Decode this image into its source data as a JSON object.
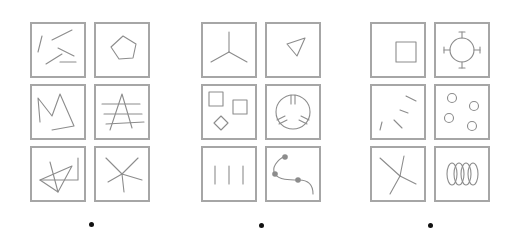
{
  "figure": {
    "type": "odd-one-out visual puzzle panels",
    "stroke_color": "#8c8c8c",
    "border_color": "#a6a6a6",
    "dot_color": "#111111",
    "groups": [
      {
        "id": "A",
        "panels": [
          {
            "row": 0,
            "col": 0,
            "shape": "five scattered line segments"
          },
          {
            "row": 0,
            "col": 1,
            "shape": "pentagon"
          },
          {
            "row": 1,
            "col": 0,
            "shape": "zigzag polyline M shape"
          },
          {
            "row": 1,
            "col": 1,
            "shape": "letter A crossed by three horizontal lines"
          },
          {
            "row": 2,
            "col": 0,
            "shape": "triangle overlapping L-shaped polyline"
          },
          {
            "row": 2,
            "col": 1,
            "shape": "five-ray star of lines"
          }
        ],
        "dot": "•"
      },
      {
        "id": "B",
        "panels": [
          {
            "row": 0,
            "col": 0,
            "shape": "three-ray Y junction"
          },
          {
            "row": 0,
            "col": 1,
            "shape": "small triangle"
          },
          {
            "row": 1,
            "col": 0,
            "shape": "two squares and a diamond"
          },
          {
            "row": 1,
            "col": 1,
            "shape": "circle with three notches"
          },
          {
            "row": 2,
            "col": 0,
            "shape": "three vertical lines"
          },
          {
            "row": 2,
            "col": 1,
            "shape": "curve with three dots"
          }
        ],
        "dot": "•"
      },
      {
        "id": "C",
        "panels": [
          {
            "row": 0,
            "col": 0,
            "shape": "small square"
          },
          {
            "row": 0,
            "col": 1,
            "shape": "circle with four tabs"
          },
          {
            "row": 1,
            "col": 0,
            "shape": "four short dashes fanning"
          },
          {
            "row": 1,
            "col": 1,
            "shape": "four small circles"
          },
          {
            "row": 2,
            "col": 0,
            "shape": "branching Y lines"
          },
          {
            "row": 2,
            "col": 1,
            "shape": "four overlapping ellipses"
          }
        ],
        "dot": "•"
      }
    ]
  }
}
